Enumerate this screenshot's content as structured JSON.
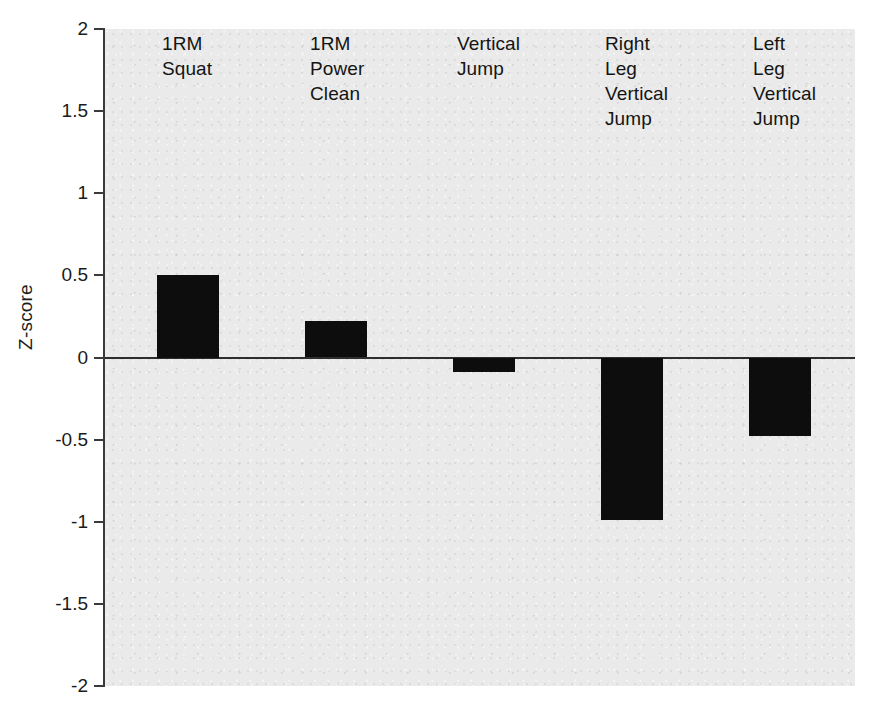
{
  "chart_data": {
    "type": "bar",
    "title": "",
    "xlabel": "",
    "ylabel": "Z-score",
    "categories": [
      "1RM\nSquat",
      "1RM\nPower\nClean",
      "Vertical\nJump",
      "Right\nLeg\nVertical\nJump",
      "Left\nLeg\nVertical\nJump"
    ],
    "values": [
      0.5,
      0.22,
      -0.09,
      -0.99,
      -0.48
    ],
    "ylim": [
      -2,
      2
    ],
    "yticks": [
      2,
      1.5,
      1,
      0.5,
      0,
      -0.5,
      -1,
      -1.5,
      -2
    ],
    "ytick_labels": [
      "2",
      "1.5",
      "1",
      "0.5",
      "0",
      "-0.5",
      "-1",
      "-1.5",
      "-2"
    ],
    "grid": false,
    "legend": "none",
    "bar_color": "#0d0d0d",
    "plot_background": "#eaeaea",
    "axis_color": "#3a3a3a"
  },
  "axis": {
    "y_title": "Z-score"
  }
}
